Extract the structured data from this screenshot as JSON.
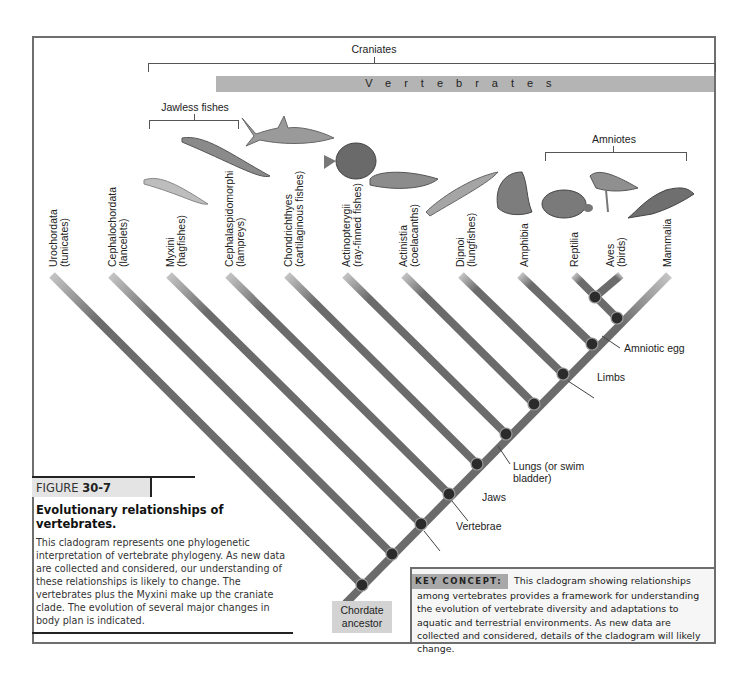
{
  "groups": {
    "craniates": "Craniates",
    "vertebrates": "Vertebrates",
    "jawless_fishes": "Jawless fishes",
    "amniotes": "Amniotes"
  },
  "taxa": [
    {
      "name": "Urochordata",
      "common": "(tunicates)"
    },
    {
      "name": "Cephalochordata",
      "common": "(lancelets)"
    },
    {
      "name": "Myxini",
      "common": "(hagfishes)"
    },
    {
      "name": "Cephalaspidomorphi",
      "common": "(lampreys)"
    },
    {
      "name": "Chondrichthyes",
      "common": "(cartilaginous fishes)"
    },
    {
      "name": "Actinopterygii",
      "common": "(ray-finned fishes)"
    },
    {
      "name": "Actinistia",
      "common": "(coelacanths)"
    },
    {
      "name": "Dipnoi",
      "common": "(lungfishes)"
    },
    {
      "name": "Amphibia",
      "common": ""
    },
    {
      "name": "Reptilia",
      "common": ""
    },
    {
      "name": "Aves",
      "common": "(birds)"
    },
    {
      "name": "Mammalia",
      "common": ""
    }
  ],
  "animals": [
    "hagfish",
    "lamprey",
    "shark",
    "ray-finned fish",
    "coelacanth",
    "lungfish",
    "frog",
    "tortoise",
    "bird",
    "platypus"
  ],
  "traits": {
    "vertebrae": "Vertebrae",
    "jaws": "Jaws",
    "lungs_line1": "Lungs (or swim",
    "lungs_line2": "bladder)",
    "limbs": "Limbs",
    "amniotic_egg": "Amniotic egg"
  },
  "root": {
    "line1": "Chordate",
    "line2": "ancestor"
  },
  "figure": {
    "label": "FIGURE ",
    "number": "30-7",
    "title": "Evolutionary relationships of vertebrates.",
    "body": "This cladogram represents one phylogenetic interpretation of vertebrate phylogeny. As new data are collected and considered, our understanding of these relationships is likely to change. The vertebrates plus the Myxini make up the craniate clade. The evolution of several major changes in body plan is indicated."
  },
  "key_concept": {
    "label": "KEY CONCEPT:",
    "text": "This cladogram showing relationships among vertebrates provides a framework for understanding the evolution of vertebrate diversity and adaptations to aquatic and terrestrial environments. As new data are collected and considered, details of the cladogram will likely change."
  },
  "colors": {
    "branch": "#6b6b6b",
    "node": "#2b2b2b",
    "vertebrates_bar": "#b4b4b4",
    "frame": "#6e6e6e",
    "key_label_bg": "#a8a8a8"
  }
}
